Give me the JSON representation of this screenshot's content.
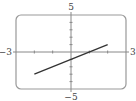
{
  "chart_data": {
    "type": "line",
    "title": "",
    "xlabel": "",
    "ylabel": "",
    "xlim": [
      -3,
      3
    ],
    "ylim": [
      -5,
      5
    ],
    "x_ticks": [
      -2,
      -1,
      1,
      2
    ],
    "y_ticks": [
      -4,
      -3,
      -2,
      -1,
      1,
      2,
      3,
      4
    ],
    "axis_labels": {
      "x_min": "−3",
      "x_max": "3",
      "y_max": "5",
      "y_min": "−5"
    },
    "grid": false,
    "series": [
      {
        "name": "line",
        "x": [
          -2,
          2
        ],
        "y": [
          -3,
          1
        ],
        "color": "#333333"
      }
    ]
  },
  "colors": {
    "frame": "#999999",
    "axes": "#888888",
    "curve": "#333333"
  }
}
